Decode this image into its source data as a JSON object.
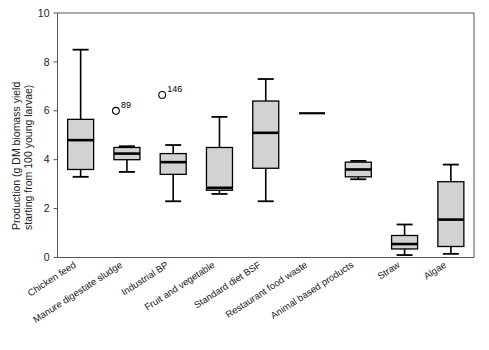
{
  "chart_data": {
    "type": "box",
    "title": "",
    "xlabel": "",
    "ylabel": "Production (g DM biomass yield starting from 100 young larvae)",
    "ylabel_line1": "Production (g DM biomass yield",
    "ylabel_line2": "starting from 100 young larvae)",
    "ylim": [
      0,
      10
    ],
    "yticks": [
      0,
      2,
      4,
      6,
      8,
      10
    ],
    "ytick_labels": [
      "0",
      "2",
      "4",
      "6",
      "8",
      "10"
    ],
    "grid": false,
    "legend": "none",
    "categories": [
      "Chicken feed",
      "Manure digestate sludge",
      "Industrial BP",
      "Fruit and vegetable",
      "Standard diet BSF",
      "Restaurant food waste",
      "Animal based products",
      "Straw",
      "Algae"
    ],
    "boxes": [
      {
        "category": "Chicken feed",
        "min": 3.3,
        "q1": 3.6,
        "median": 4.8,
        "q3": 5.65,
        "max": 8.5,
        "single_value": null,
        "outliers": []
      },
      {
        "category": "Manure digestate sludge",
        "min": 3.5,
        "q1": 4.0,
        "median": 4.25,
        "q3": 4.5,
        "max": 4.55,
        "single_value": null,
        "outliers": [
          {
            "value": 6.0,
            "label": "89"
          }
        ]
      },
      {
        "category": "Industrial BP",
        "min": 2.3,
        "q1": 3.4,
        "median": 3.9,
        "q3": 4.25,
        "max": 4.6,
        "single_value": null,
        "outliers": [
          {
            "value": 6.65,
            "label": "146"
          }
        ]
      },
      {
        "category": "Fruit and vegetable",
        "min": 2.6,
        "q1": 2.75,
        "median": 2.85,
        "q3": 4.5,
        "max": 5.75,
        "single_value": null,
        "outliers": []
      },
      {
        "category": "Standard diet BSF",
        "min": 2.3,
        "q1": 3.65,
        "median": 5.1,
        "q3": 6.4,
        "max": 7.3,
        "single_value": null,
        "outliers": []
      },
      {
        "category": "Restaurant food waste",
        "min": null,
        "q1": null,
        "median": null,
        "q3": null,
        "max": null,
        "single_value": 5.9,
        "outliers": []
      },
      {
        "category": "Animal based products",
        "min": 3.2,
        "q1": 3.3,
        "median": 3.6,
        "q3": 3.9,
        "max": 3.95,
        "single_value": null,
        "outliers": []
      },
      {
        "category": "Straw",
        "min": 0.1,
        "q1": 0.35,
        "median": 0.55,
        "q3": 0.9,
        "max": 1.35,
        "single_value": null,
        "outliers": []
      },
      {
        "category": "Algae",
        "min": 0.15,
        "q1": 0.45,
        "median": 1.55,
        "q3": 3.1,
        "max": 3.8,
        "single_value": null,
        "outliers": []
      }
    ],
    "colors": {
      "box_fill": "#d2d2d2",
      "box_stroke": "#000000",
      "axis": "#555555",
      "text": "#222222",
      "background": "#ffffff"
    }
  }
}
